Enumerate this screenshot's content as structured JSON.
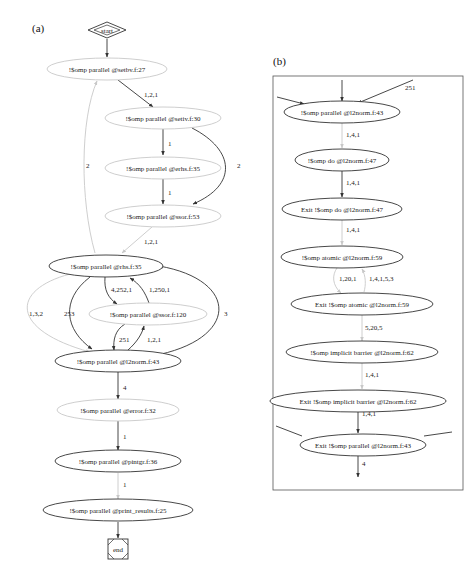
{
  "panel_a": {
    "label": "(a)",
    "start_label": "start",
    "end_label": "end",
    "nodes": [
      {
        "id": "setbv",
        "label": "!$omp parallel @setbv.f:27",
        "style": "light"
      },
      {
        "id": "setiv",
        "label": "!$omp parallel @setiv.f:30",
        "style": "light"
      },
      {
        "id": "erhs",
        "label": "!$omp parallel @erhs.f:35",
        "style": "light"
      },
      {
        "id": "ssor53",
        "label": "!$omp parallel @ssor.f:53",
        "style": "light"
      },
      {
        "id": "rhs",
        "label": "!$omp parallel @rhs.f:35",
        "style": "dark"
      },
      {
        "id": "ssor120",
        "label": "!$omp parallel @ssor.f:120",
        "style": "light"
      },
      {
        "id": "l2norm",
        "label": "!$omp parallel @l2norm.f:43",
        "style": "dark"
      },
      {
        "id": "error",
        "label": "!$omp parallel @error.f:32",
        "style": "light"
      },
      {
        "id": "pintgr",
        "label": "!$omp parallel @pintgr.f:36",
        "style": "dark"
      },
      {
        "id": "print_results",
        "label": "!$omp parallel @print_results.f:25",
        "style": "dark"
      }
    ],
    "edges": [
      {
        "from": "start",
        "to": "setbv",
        "label": ""
      },
      {
        "from": "setbv",
        "to": "setiv",
        "label": "1,2,1"
      },
      {
        "from": "setiv",
        "to": "erhs",
        "label": "1"
      },
      {
        "from": "setiv",
        "to": "ssor53",
        "label": "2"
      },
      {
        "from": "erhs",
        "to": "ssor53",
        "label": "1"
      },
      {
        "from": "ssor53",
        "to": "rhs",
        "label": "1,2,1"
      },
      {
        "from": "rhs",
        "to": "setbv",
        "label": "2"
      },
      {
        "from": "rhs",
        "to": "ssor120",
        "label": "4,252,1"
      },
      {
        "from": "ssor120",
        "to": "rhs",
        "label": "1,250,1"
      },
      {
        "from": "rhs",
        "to": "l2norm",
        "label": "1,3,2"
      },
      {
        "from": "rhs",
        "to": "l2norm",
        "label": "253"
      },
      {
        "from": "ssor120",
        "to": "l2norm",
        "label": "251"
      },
      {
        "from": "l2norm",
        "to": "ssor120",
        "label": "1,2,1"
      },
      {
        "from": "l2norm",
        "to": "rhs",
        "label": "3"
      },
      {
        "from": "l2norm",
        "to": "error",
        "label": "4"
      },
      {
        "from": "error",
        "to": "pintgr",
        "label": "1"
      },
      {
        "from": "pintgr",
        "to": "print_results",
        "label": "1"
      },
      {
        "from": "print_results",
        "to": "end",
        "label": ""
      }
    ]
  },
  "panel_b": {
    "label": "(b)",
    "nodes": [
      {
        "id": "par43",
        "label": "!$omp parallel @l2norm.f:43"
      },
      {
        "id": "do47",
        "label": "!$omp do @l2norm.f:47"
      },
      {
        "id": "exitdo47",
        "label": "Exit !$omp do @l2norm.f:47"
      },
      {
        "id": "atomic59",
        "label": "!$omp atomic @l2norm.f:59"
      },
      {
        "id": "exitatomic59",
        "label": "Exit !$omp atomic @l2norm.f:59"
      },
      {
        "id": "barrier62",
        "label": "!$omp implicit barrier @l2norm.f:62"
      },
      {
        "id": "exitbarrier62",
        "label": "Exit !$omp implicit barrier @l2norm.f:62"
      },
      {
        "id": "exitpar43",
        "label": "Exit !$omp parallel @l2norm.f:43"
      }
    ],
    "edges": [
      {
        "from": "incoming",
        "to": "par43",
        "label": "251"
      },
      {
        "from": "par43",
        "to": "do47",
        "label": "1,4,1"
      },
      {
        "from": "do47",
        "to": "exitdo47",
        "label": "1,4,1"
      },
      {
        "from": "exitdo47",
        "to": "atomic59",
        "label": "1,4,1"
      },
      {
        "from": "atomic59",
        "to": "exitatomic59",
        "label": "1,20,1"
      },
      {
        "from": "exitatomic59",
        "to": "atomic59",
        "label": "1,4,1,5,3"
      },
      {
        "from": "exitatomic59",
        "to": "barrier62",
        "label": "5,20,5"
      },
      {
        "from": "barrier62",
        "to": "exitbarrier62",
        "label": "1,4,1"
      },
      {
        "from": "exitbarrier62",
        "to": "exitpar43",
        "label": "1,4,1"
      },
      {
        "from": "exitpar43",
        "to": "outgoing",
        "label": "4"
      }
    ]
  }
}
